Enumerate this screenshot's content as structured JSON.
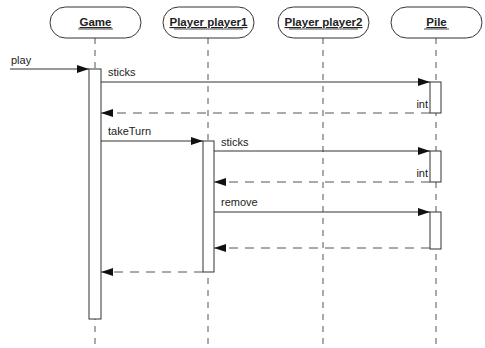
{
  "diagram": {
    "type": "uml-sequence",
    "participants": [
      {
        "id": "game",
        "label": "Game",
        "x": 95
      },
      {
        "id": "player1",
        "label": "Player player1",
        "x": 208
      },
      {
        "id": "player2",
        "label": "Player player2",
        "x": 323
      },
      {
        "id": "pile",
        "label": "Pile",
        "x": 436
      }
    ],
    "messages": [
      {
        "from": "external",
        "to": "game",
        "label": "play",
        "kind": "call"
      },
      {
        "from": "game",
        "to": "pile",
        "label": "sticks",
        "kind": "call"
      },
      {
        "from": "pile",
        "to": "game",
        "label": "int",
        "kind": "return"
      },
      {
        "from": "game",
        "to": "player1",
        "label": "takeTurn",
        "kind": "call"
      },
      {
        "from": "player1",
        "to": "pile",
        "label": "sticks",
        "kind": "call"
      },
      {
        "from": "pile",
        "to": "player1",
        "label": "int",
        "kind": "return"
      },
      {
        "from": "player1",
        "to": "pile",
        "label": "remove",
        "kind": "call"
      },
      {
        "from": "pile",
        "to": "player1",
        "label": "",
        "kind": "return"
      },
      {
        "from": "player1",
        "to": "game",
        "label": "",
        "kind": "return"
      }
    ],
    "colors": {
      "line": "#333333",
      "dash": "#555555",
      "background": "#ffffff"
    }
  }
}
